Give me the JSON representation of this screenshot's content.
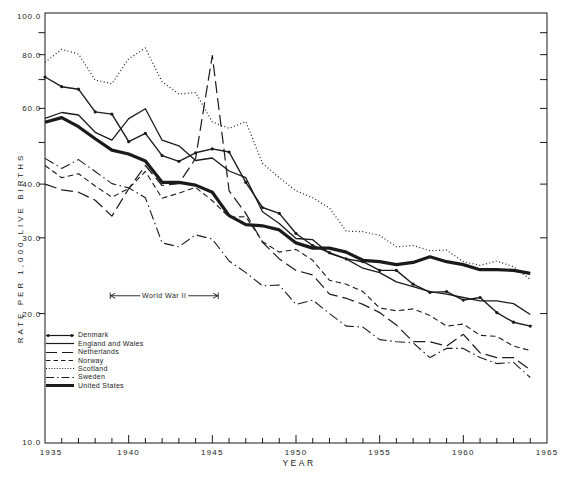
{
  "colors": {
    "ink": "#1b1b1b",
    "paper": "#ffffff"
  },
  "chart_data": {
    "type": "line",
    "title": "",
    "xlabel": "YEAR",
    "ylabel": "RATE PER 1,000 LIVE BIRTHS",
    "y_scale": "log",
    "xlim": [
      1935,
      1965
    ],
    "ylim": [
      10,
      100
    ],
    "x_tick_labels": [
      "1935",
      "1940",
      "1945",
      "1950",
      "1955",
      "1960",
      "1965"
    ],
    "y_tick_labels": [
      "100.0",
      "80.0",
      "60.0",
      "40.0",
      "30.0",
      "20.0",
      "10.0"
    ],
    "y_minor_ticks": [
      90,
      70,
      50
    ],
    "right_axis_tick_values": [
      90,
      80,
      70,
      60,
      50,
      40,
      30,
      20
    ],
    "x_minor_ticks_every_year": true,
    "grid": false,
    "legend_position": "lower-left-inside",
    "years": [
      1935,
      1936,
      1937,
      1938,
      1939,
      1940,
      1941,
      1942,
      1943,
      1944,
      1945,
      1946,
      1947,
      1948,
      1949,
      1950,
      1951,
      1952,
      1953,
      1954,
      1955,
      1956,
      1957,
      1958,
      1959,
      1960,
      1961,
      1962,
      1963,
      1964
    ],
    "series": [
      {
        "name": "Denmark",
        "style": "solid-markers",
        "values": [
          71.0,
          67.4,
          66.5,
          58.9,
          58.2,
          50.2,
          52.5,
          46.6,
          45.2,
          47.3,
          48.3,
          47.5,
          40.4,
          35.3,
          34.2,
          30.7,
          28.8,
          27.7,
          26.8,
          26.4,
          25.2,
          25.2,
          23.4,
          22.4,
          22.5,
          21.5,
          21.8,
          20.1,
          19.1,
          18.7
        ]
      },
      {
        "name": "England and Wales",
        "style": "solid",
        "values": [
          56.9,
          58.7,
          57.9,
          52.8,
          50.6,
          56.8,
          59.9,
          50.6,
          49.1,
          45.4,
          46.0,
          42.9,
          41.4,
          34.5,
          32.4,
          29.9,
          29.7,
          27.6,
          26.8,
          25.5,
          24.9,
          23.7,
          23.1,
          22.5,
          22.2,
          21.8,
          21.4,
          21.4,
          21.1,
          19.9
        ]
      },
      {
        "name": "Netherlands",
        "style": "long-dash",
        "values": [
          40.0,
          38.8,
          38.3,
          36.7,
          33.7,
          39.0,
          44.2,
          39.7,
          40.1,
          45.9,
          79.6,
          38.6,
          34.2,
          29.3,
          26.8,
          25.2,
          24.6,
          22.2,
          21.7,
          21.0,
          20.1,
          18.8,
          17.2,
          17.2,
          16.8,
          17.9,
          16.2,
          15.8,
          15.8,
          14.8
        ]
      },
      {
        "name": "Norway",
        "style": "dash",
        "values": [
          44.2,
          41.4,
          42.3,
          39.6,
          37.3,
          39.1,
          42.8,
          37.1,
          38.1,
          39.3,
          36.6,
          33.5,
          33.6,
          29.4,
          27.8,
          28.2,
          26.6,
          23.9,
          23.4,
          22.5,
          20.6,
          20.3,
          20.5,
          19.8,
          18.7,
          18.9,
          17.8,
          17.7,
          16.8,
          16.4
        ]
      },
      {
        "name": "Scotland",
        "style": "dotted",
        "values": [
          76.8,
          82.3,
          80.3,
          69.8,
          68.5,
          78.3,
          82.9,
          69.2,
          64.8,
          65.3,
          55.8,
          53.9,
          55.9,
          44.7,
          41.4,
          38.6,
          37.2,
          35.2,
          31.1,
          31.0,
          30.4,
          28.6,
          28.8,
          28.0,
          28.1,
          26.4,
          25.9,
          26.5,
          25.7,
          24.0
        ]
      },
      {
        "name": "Sweden",
        "style": "dash-dot",
        "values": [
          45.9,
          43.5,
          45.6,
          42.8,
          40.1,
          39.2,
          37.2,
          29.2,
          28.6,
          30.5,
          29.8,
          26.5,
          24.9,
          23.2,
          23.3,
          21.0,
          21.5,
          20.0,
          18.7,
          18.6,
          17.4,
          17.2,
          17.1,
          15.8,
          16.6,
          16.6,
          15.8,
          15.3,
          15.4,
          14.2
        ]
      },
      {
        "name": "United States",
        "style": "thick-solid",
        "values": [
          55.7,
          57.1,
          54.4,
          51.0,
          48.0,
          47.0,
          45.3,
          40.4,
          40.4,
          39.8,
          38.3,
          33.8,
          32.2,
          32.0,
          31.3,
          29.2,
          28.4,
          28.4,
          27.8,
          26.6,
          26.4,
          26.0,
          26.3,
          27.1,
          26.4,
          26.0,
          25.3,
          25.3,
          25.2,
          24.8
        ]
      }
    ],
    "annotations": [
      {
        "label": "World War II",
        "x_from": 1938.9,
        "x_to": 1945.35,
        "y": 22.0
      }
    ]
  }
}
